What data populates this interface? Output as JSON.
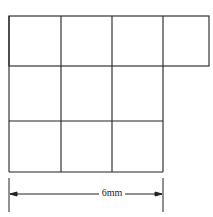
{
  "diagram": {
    "type": "grid-of-squares",
    "rows": [
      {
        "squares": 4
      },
      {
        "squares": 3
      },
      {
        "squares": 3
      }
    ],
    "total_squares": 10,
    "dimension": {
      "label": "6mm",
      "spans": "width of 3 squares"
    },
    "colors": {
      "line": "#222222",
      "background": "#ffffff"
    }
  }
}
